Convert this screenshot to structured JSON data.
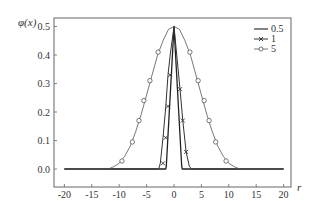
{
  "chart_data": {
    "type": "line",
    "title": "",
    "xlabel": "r",
    "ylabel": "φ(x)",
    "xlim": [
      -21,
      21
    ],
    "ylim": [
      -0.02,
      0.52
    ],
    "xticks": [
      -20,
      -15,
      -10,
      -5,
      0,
      5,
      10,
      15,
      20
    ],
    "xtick_labels": [
      "-20",
      "-15",
      "-10",
      "-5",
      "0",
      "5",
      "10",
      "15",
      "20"
    ],
    "yticks": [
      0.0,
      0.1,
      0.2,
      0.3,
      0.4,
      0.5
    ],
    "ytick_labels": [
      "0.0",
      "0.1",
      "0.2",
      "0.3",
      "0.4",
      "0.5"
    ],
    "grid": false,
    "legend_position": "upper right",
    "series": [
      {
        "name": "0.5",
        "marker": "none",
        "x": [
          -20,
          -1.5,
          -1.4,
          0,
          1.4,
          1.5,
          20
        ],
        "y": [
          0.0,
          0.0,
          0.01,
          0.5,
          0.01,
          0.0,
          0.0
        ]
      },
      {
        "name": "1",
        "marker": "x",
        "x": [
          -20,
          -2.8,
          -2.5,
          -2.0,
          -1.5,
          -1.1,
          -0.7,
          0,
          1.1,
          1.6,
          2.2,
          2.8,
          3.2,
          20
        ],
        "y": [
          0.0,
          0.0,
          0.02,
          0.11,
          0.22,
          0.33,
          0.4,
          0.5,
          0.28,
          0.17,
          0.06,
          0.01,
          0.0,
          0.0
        ],
        "marker_x": [
          -2.0,
          -1.5,
          -1.1,
          -0.7,
          1.1,
          1.6,
          2.2
        ],
        "marker_y": [
          0.02,
          0.11,
          0.22,
          0.33,
          0.28,
          0.17,
          0.06
        ]
      },
      {
        "name": "5",
        "marker": "o",
        "x": [
          -20,
          -12,
          -11,
          -10,
          -9,
          -8,
          -7,
          -6,
          -5,
          -4,
          -3,
          -2,
          -1,
          0,
          1,
          2,
          3,
          4,
          5,
          6,
          7,
          8,
          9,
          10,
          11,
          12,
          20
        ],
        "y": [
          0.0,
          0.0,
          0.008,
          0.02,
          0.045,
          0.08,
          0.13,
          0.19,
          0.26,
          0.33,
          0.4,
          0.45,
          0.49,
          0.5,
          0.49,
          0.45,
          0.4,
          0.33,
          0.26,
          0.19,
          0.13,
          0.08,
          0.045,
          0.02,
          0.008,
          0.0,
          0.0
        ],
        "marker_x": [
          -9.5,
          -7.6,
          -6.4,
          -5.5,
          -4.4,
          -2.9,
          2.9,
          4.4,
          5.5,
          6.4,
          7.6,
          9.5
        ],
        "marker_y": [
          0.028,
          0.095,
          0.17,
          0.24,
          0.31,
          0.41,
          0.41,
          0.31,
          0.24,
          0.17,
          0.095,
          0.028
        ]
      }
    ]
  },
  "legend": {
    "items": [
      {
        "label": "0.5"
      },
      {
        "label": "1"
      },
      {
        "label": "5"
      }
    ]
  },
  "axes": {
    "xlabel": "r",
    "ylabel": "φ(x)"
  },
  "colors": {
    "line": "#333333",
    "frame": "#555555"
  }
}
